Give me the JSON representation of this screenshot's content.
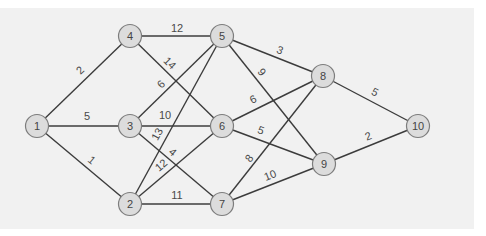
{
  "diagram": {
    "type": "weighted-undirected-graph",
    "colors": {
      "background": "#ffffff",
      "panel": "#f1f1f1",
      "edge": "#3c3c3c",
      "node_fill": "#dcdcdc",
      "node_stroke": "#7d7d7d",
      "text": "#444444"
    },
    "nodes": [
      {
        "id": "1",
        "label": "1",
        "x": 37,
        "y": 126
      },
      {
        "id": "2",
        "label": "2",
        "x": 130,
        "y": 204
      },
      {
        "id": "3",
        "label": "3",
        "x": 130,
        "y": 126
      },
      {
        "id": "4",
        "label": "4",
        "x": 130,
        "y": 36
      },
      {
        "id": "5",
        "label": "5",
        "x": 222,
        "y": 36
      },
      {
        "id": "6",
        "label": "6",
        "x": 222,
        "y": 126
      },
      {
        "id": "7",
        "label": "7",
        "x": 222,
        "y": 204
      },
      {
        "id": "8",
        "label": "8",
        "x": 323,
        "y": 76
      },
      {
        "id": "9",
        "label": "9",
        "x": 324,
        "y": 164
      },
      {
        "id": "10",
        "label": "10",
        "x": 418,
        "y": 126
      }
    ],
    "edges": [
      {
        "from": "1",
        "to": "4",
        "weight": "2",
        "lx": 80,
        "ly": 70
      },
      {
        "from": "1",
        "to": "3",
        "weight": "5",
        "lx": 87,
        "ly": 116
      },
      {
        "from": "1",
        "to": "2",
        "weight": "1",
        "lx": 92,
        "ly": 160
      },
      {
        "from": "4",
        "to": "5",
        "weight": "12",
        "lx": 177,
        "ly": 28
      },
      {
        "from": "4",
        "to": "6",
        "weight": "14",
        "lx": 170,
        "ly": 63
      },
      {
        "from": "3",
        "to": "5",
        "weight": "6",
        "lx": 161,
        "ly": 84
      },
      {
        "from": "3",
        "to": "6",
        "weight": "10",
        "lx": 165,
        "ly": 115
      },
      {
        "from": "3",
        "to": "7",
        "weight": "4",
        "lx": 173,
        "ly": 152
      },
      {
        "from": "2",
        "to": "5",
        "weight": "13",
        "lx": 157,
        "ly": 134
      },
      {
        "from": "2",
        "to": "6",
        "weight": "12",
        "lx": 161,
        "ly": 165
      },
      {
        "from": "2",
        "to": "7",
        "weight": "11",
        "lx": 177,
        "ly": 195
      },
      {
        "from": "5",
        "to": "8",
        "weight": "3",
        "lx": 280,
        "ly": 50
      },
      {
        "from": "5",
        "to": "9",
        "weight": "9",
        "lx": 262,
        "ly": 72
      },
      {
        "from": "6",
        "to": "8",
        "weight": "6",
        "lx": 253,
        "ly": 99
      },
      {
        "from": "6",
        "to": "9",
        "weight": "5",
        "lx": 261,
        "ly": 130
      },
      {
        "from": "7",
        "to": "8",
        "weight": "8",
        "lx": 249,
        "ly": 158
      },
      {
        "from": "7",
        "to": "9",
        "weight": "10",
        "lx": 270,
        "ly": 175
      },
      {
        "from": "8",
        "to": "10",
        "weight": "5",
        "lx": 375,
        "ly": 92
      },
      {
        "from": "9",
        "to": "10",
        "weight": "2",
        "lx": 368,
        "ly": 136
      }
    ]
  }
}
